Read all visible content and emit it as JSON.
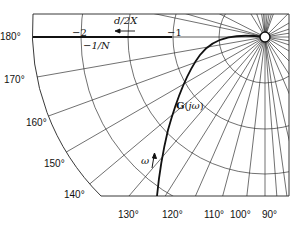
{
  "diagram": {
    "type": "polar-plot (describing function / Nyquist)",
    "origin_px": [
      265,
      37
    ],
    "unit_px": 92,
    "colors": {
      "lines": "#222222",
      "background": "#ffffff"
    },
    "labels": {
      "minus_two": "−2",
      "minus_one": "−1",
      "describing_fn": "−1/N",
      "d_over_2x": "d/2X",
      "transfer_fn": "G(jω)",
      "omega": "ω"
    },
    "angle_labels": {
      "left": [
        "180°",
        "170°",
        "160°",
        "150°",
        "140°"
      ],
      "bottom": [
        "130°",
        "120°",
        "110°",
        "100°",
        "90°"
      ]
    },
    "arcs_radius": [
      0.5,
      1,
      2,
      2.5
    ],
    "radial_angles_deg": [
      90,
      95,
      100,
      105,
      110,
      115,
      120,
      125,
      130,
      135,
      140,
      145,
      150,
      155,
      160,
      165,
      170,
      175,
      180,
      185,
      190,
      195,
      200,
      205,
      210,
      215,
      220,
      225,
      230,
      235,
      240,
      245,
      250,
      255,
      260,
      265,
      270,
      275,
      280,
      285,
      290,
      295,
      300,
      305,
      310,
      315,
      320,
      325,
      330,
      335,
      340,
      345,
      350,
      355
    ]
  }
}
